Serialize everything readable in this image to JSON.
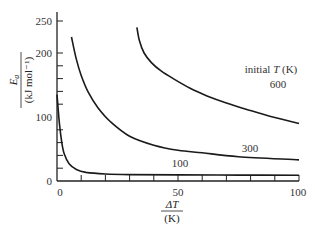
{
  "chart_data": {
    "type": "line",
    "title": "",
    "xlabel": "ΔT / (K)",
    "ylabel": "E_a / (kJ mol⁻¹)",
    "xlim": [
      0,
      100
    ],
    "ylim": [
      0,
      250
    ],
    "x_ticks_labeled": [
      0,
      50,
      100
    ],
    "x_minor_ticks": [
      10,
      20,
      30,
      40,
      50,
      60,
      70,
      80,
      90,
      100
    ],
    "y_ticks_labeled": [
      0,
      100,
      200,
      250
    ],
    "y_minor_ticks": [
      20,
      40,
      60,
      80,
      120,
      140,
      160,
      180,
      200,
      250
    ],
    "grid": false,
    "legend_title": "initial T (K)",
    "series": [
      {
        "name": "100",
        "x": [
          0,
          1,
          2,
          3,
          5,
          8,
          12,
          20,
          30,
          50,
          75,
          100
        ],
        "y": [
          135,
          90,
          60,
          42,
          27,
          18,
          13.5,
          11,
          10,
          9.5,
          9.2,
          9
        ]
      },
      {
        "name": "300",
        "x": [
          6,
          8,
          10,
          13,
          17,
          22,
          30,
          40,
          50,
          60,
          75,
          100
        ],
        "y": [
          225,
          190,
          165,
          138,
          114,
          93,
          70,
          56,
          48,
          44,
          38,
          33
        ]
      },
      {
        "name": "600",
        "x": [
          33,
          34,
          36,
          39,
          43,
          48,
          55,
          62,
          70,
          80,
          90,
          100
        ],
        "y": [
          240,
          220,
          200,
          185,
          172,
          160,
          145,
          133,
          122,
          110,
          99,
          90
        ]
      }
    ]
  },
  "labels": {
    "x_axis_numerator": "ΔT",
    "x_axis_denominator": "(K)",
    "y_axis_numerator": "E",
    "y_axis_subscript": "a",
    "y_axis_denominator": "(kJ mol⁻¹)",
    "legend_title_prefix": "initial ",
    "legend_title_var": "T",
    "legend_title_suffix": " (K)",
    "series_100": "100",
    "series_300": "300",
    "series_600": "600",
    "ytick_0": "0",
    "ytick_100": "100",
    "ytick_200": "200",
    "ytick_250": "250",
    "xtick_0": "0",
    "xtick_50": "50",
    "xtick_100": "100"
  },
  "colors": {
    "line": "#1a1a1a",
    "axis": "#222222",
    "text": "#333333"
  }
}
